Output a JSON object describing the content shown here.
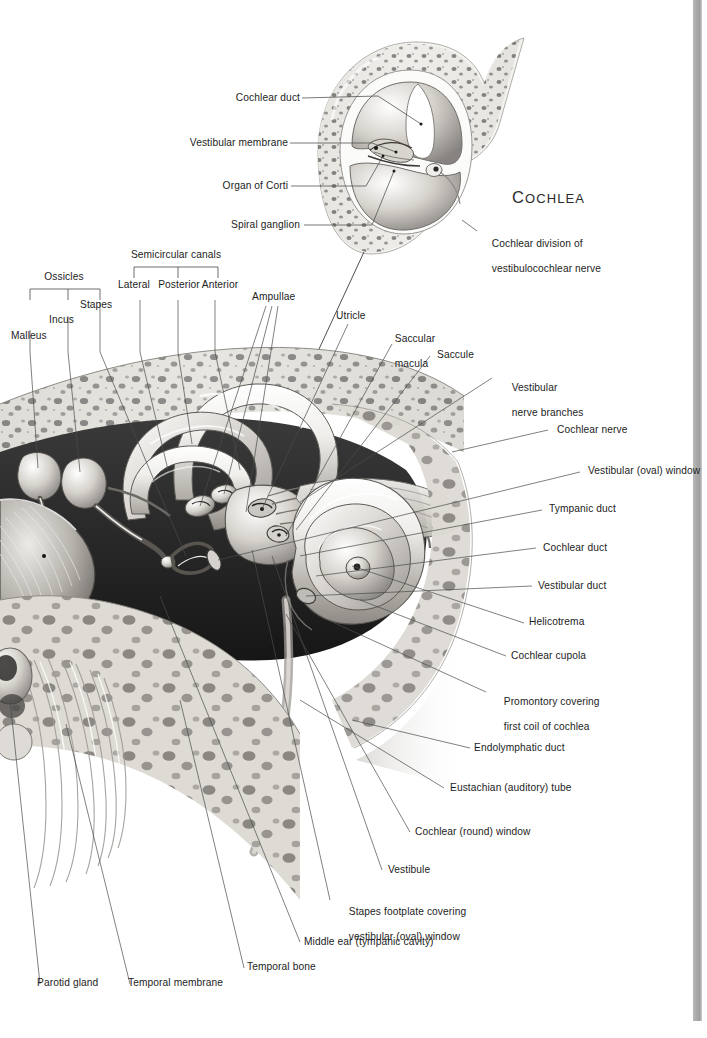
{
  "plate": {
    "title": "COCHLEA",
    "title_first": "C",
    "title_rest": "OCHLEA"
  },
  "inset_labels": {
    "cochlear_duct": "Cochlear duct",
    "vestibular_membrane": "Vestibular membrane",
    "organ_of_corti": "Organ of Corti",
    "spiral_ganglion": "Spiral ganglion",
    "cochlear_division_l1": "Cochlear division of",
    "cochlear_division_l2": "vestibulocochlear nerve"
  },
  "bracket_labels": {
    "ossicles": "Ossicles",
    "malleus": "Malleus",
    "incus": "Incus",
    "stapes": "Stapes",
    "semicircular_canals": "Semicircular canals",
    "lateral": "Lateral",
    "posterior": "Posterior",
    "anterior": "Anterior"
  },
  "upper_labels": {
    "ampullae": "Ampullae",
    "utricle": "Utricle",
    "saccular_macula_l1": "Saccular",
    "saccular_macula_l2": "macula",
    "saccule": "Saccule",
    "vestibular_nerve_l1": "Vestibular",
    "vestibular_nerve_l2": "nerve branches"
  },
  "right_labels": [
    {
      "key": "cochlear-nerve",
      "text": "Cochlear nerve"
    },
    {
      "key": "vestibular-oval-window",
      "text": "Vestibular (oval) window"
    },
    {
      "key": "tympanic-duct",
      "text": "Tympanic duct"
    },
    {
      "key": "cochlear-duct",
      "text": "Cochlear duct"
    },
    {
      "key": "vestibular-duct",
      "text": "Vestibular duct"
    },
    {
      "key": "helicotrema",
      "text": "Helicotrema"
    },
    {
      "key": "cochlear-cupola",
      "text": "Cochlear cupola"
    }
  ],
  "right_labels_2": {
    "promontory_l1": "Promontory covering",
    "promontory_l2": "first coil of cochlea",
    "endolymphatic_duct": "Endolymphatic duct",
    "eustachian_tube": "Eustachian (auditory) tube",
    "cochlear_round_window": "Cochlear (round) window",
    "vestibule": "Vestibule",
    "stapes_footplate_l1": "Stapes footplate covering",
    "stapes_footplate_l2": "vestibular (oval) window",
    "middle_ear": "Middle ear (tympanic cavity)"
  },
  "bottom_labels": {
    "parotid_gland": "Parotid gland",
    "temporal_membrane": "Temporal membrane",
    "temporal_bone": "Temporal bone"
  },
  "colors": {
    "ink": "#1d1d1d",
    "leader": "#555555",
    "bone_light": "#e8e6e2",
    "bone_mid": "#b9b6b0",
    "cavity_dark": "#2b2b2b",
    "gutter": "#a8a8a8"
  }
}
